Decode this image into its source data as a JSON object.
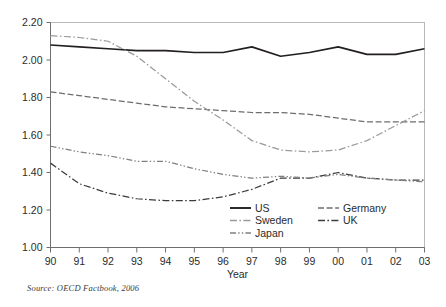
{
  "chart_data": {
    "type": "line",
    "title": "",
    "xlabel": "Year",
    "ylabel": "",
    "x": [
      "90",
      "91",
      "92",
      "93",
      "94",
      "95",
      "96",
      "97",
      "98",
      "99",
      "00",
      "01",
      "02",
      "03"
    ],
    "xlim": [
      0,
      13
    ],
    "ylim": [
      1.0,
      2.2
    ],
    "yticks": [
      "1.00",
      "1.20",
      "1.40",
      "1.60",
      "1.80",
      "2.00",
      "2.20"
    ],
    "grid": false,
    "legend_position": "inside-bottom-center",
    "source_note": "Source:  OECD Factbook, 2006",
    "series": [
      {
        "name": "US",
        "style": "solid",
        "color": "#231f20",
        "values": [
          2.08,
          2.07,
          2.06,
          2.05,
          2.05,
          2.04,
          2.04,
          2.07,
          2.02,
          2.04,
          2.07,
          2.03,
          2.03,
          2.06
        ]
      },
      {
        "name": "Germany",
        "style": "dashed",
        "color": "#6d6d6d",
        "values": [
          1.83,
          1.81,
          1.79,
          1.77,
          1.75,
          1.74,
          1.73,
          1.72,
          1.72,
          1.71,
          1.69,
          1.67,
          1.67,
          1.67
        ]
      },
      {
        "name": "Sweden",
        "style": "dash-dot",
        "color": "#9a9a9a",
        "values": [
          2.13,
          2.12,
          2.1,
          2.02,
          1.9,
          1.78,
          1.68,
          1.57,
          1.52,
          1.51,
          1.52,
          1.57,
          1.65,
          1.73
        ]
      },
      {
        "name": "UK",
        "style": "dash-dot",
        "color": "#3c3c3c",
        "values": [
          1.45,
          1.34,
          1.29,
          1.26,
          1.25,
          1.25,
          1.27,
          1.31,
          1.37,
          1.37,
          1.4,
          1.37,
          1.36,
          1.36
        ]
      },
      {
        "name": "Japan",
        "style": "dash-dot-dot",
        "color": "#808080",
        "values": [
          1.54,
          1.51,
          1.49,
          1.46,
          1.46,
          1.42,
          1.39,
          1.37,
          1.38,
          1.37,
          1.39,
          1.37,
          1.36,
          1.35
        ]
      }
    ]
  },
  "legend": {
    "entries": [
      {
        "label": "US"
      },
      {
        "label": "Germany"
      },
      {
        "label": "Sweden"
      },
      {
        "label": "UK"
      },
      {
        "label": "Japan"
      }
    ]
  },
  "axes": {
    "x_title": "Year"
  },
  "footer": {
    "source": "Source:  OECD Factbook, 2006"
  }
}
